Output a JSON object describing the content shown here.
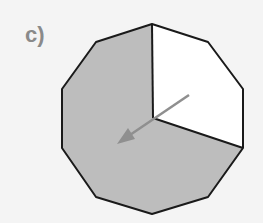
{
  "label": "c)",
  "figure": {
    "shape": "regular decagon",
    "sides": 10,
    "shaded_fraction": "7/10",
    "unshaded_fraction": "3/10",
    "shade_color": "#bdbdbd",
    "outline_color": "#1a1a1a",
    "arrow_color": "#8f8f8f",
    "arrow_direction": "counter-clockwise / toward lower-left"
  }
}
